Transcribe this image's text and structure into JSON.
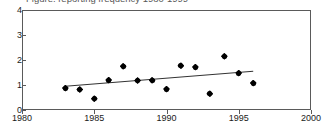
{
  "figure": {
    "title_clipped": "Figure: reporting frequency 1980-1999",
    "title_visible": false
  },
  "chart_data": {
    "type": "scatter",
    "title": "",
    "xlabel": "",
    "ylabel": "",
    "xlim": [
      1980,
      2000
    ],
    "ylim": [
      0,
      4
    ],
    "xticks": [
      1980,
      1985,
      1990,
      1995,
      2000
    ],
    "yticks": [
      0,
      1,
      2,
      3,
      4
    ],
    "xtick_labels": [
      "1980",
      "1985",
      "1990",
      "1995",
      "2000"
    ],
    "ytick_labels": [
      "0",
      "1",
      "2",
      "3",
      "4"
    ],
    "grid": false,
    "legend": null,
    "series": [
      {
        "name": "observations",
        "marker": "diamond",
        "color": "#000000",
        "x": [
          1983,
          1984,
          1985,
          1986,
          1987,
          1988,
          1989,
          1990,
          1991,
          1992,
          1993,
          1994,
          1995,
          1996
        ],
        "y": [
          0.88,
          0.82,
          0.45,
          1.2,
          1.75,
          1.18,
          1.19,
          0.84,
          1.77,
          1.72,
          0.65,
          2.15,
          1.48,
          1.08
        ]
      },
      {
        "name": "trend-line",
        "type": "line",
        "color": "#333333",
        "x": [
          1983,
          1996
        ],
        "y": [
          0.95,
          1.55
        ]
      }
    ]
  }
}
